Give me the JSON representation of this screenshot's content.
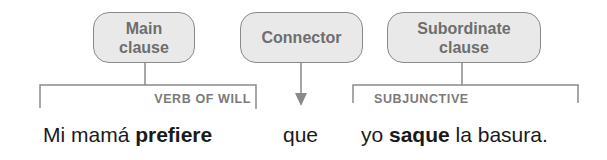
{
  "diagram": {
    "boxes": {
      "main": {
        "line1": "Main",
        "line2": "clause"
      },
      "connector": {
        "line1": "Connector"
      },
      "subordinate": {
        "line1": "Subordinate",
        "line2": "clause"
      }
    },
    "labels": {
      "main": "VERB OF WILL",
      "subordinate": "SUBJUNCTIVE"
    },
    "sentence": {
      "main_plain": "Mi mamá ",
      "main_bold": "prefiere",
      "connector": "que",
      "sub_pre": "yo ",
      "sub_bold": "saque",
      "sub_post": " la basura."
    },
    "colors": {
      "box_fill": "#e9e9e9",
      "box_border": "#8a8a8a",
      "box_text": "#6e6e6e",
      "line": "#8a8a8a",
      "label_text": "#7a7a7a",
      "sentence_text": "#1a1a1a"
    }
  }
}
